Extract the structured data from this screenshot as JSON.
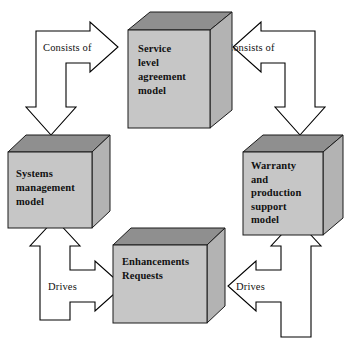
{
  "diagram": {
    "palette": {
      "box_front": "#c6c6c6",
      "box_top": "#8f8f8f",
      "box_side": "#b3b3b3",
      "box_outline": "#1a1a1a",
      "arrow_fill": "#ffffff",
      "arrow_outline": "#000000",
      "text": "#111111",
      "background": "#ffffff"
    },
    "nodes": [
      {
        "id": "service-level-agreement-model",
        "position": "top",
        "lines": [
          "Service",
          "level",
          "agreement",
          "model"
        ]
      },
      {
        "id": "systems-management-model",
        "position": "left",
        "lines": [
          "Systems",
          "management",
          "model"
        ]
      },
      {
        "id": "warranty-and-production-support-model",
        "position": "right",
        "lines": [
          "Warranty",
          "and",
          "production",
          "support",
          "model"
        ]
      },
      {
        "id": "enhancements-requests",
        "position": "bottom",
        "lines": [
          "Enhancements",
          "Requests"
        ]
      }
    ],
    "connectors": [
      {
        "id": "connector-top-left",
        "label": "Consists of",
        "from": "service-level-agreement-model",
        "to": "systems-management-model",
        "heads": [
          "right",
          "down"
        ]
      },
      {
        "id": "connector-top-right",
        "label": "Consists of",
        "from": "service-level-agreement-model",
        "to": "warranty-and-production-support-model",
        "heads": [
          "left",
          "down"
        ]
      },
      {
        "id": "connector-bottom-left",
        "label": "Drives",
        "from": "enhancements-requests",
        "to": "systems-management-model",
        "heads": [
          "up",
          "right"
        ]
      },
      {
        "id": "connector-bottom-right",
        "label": "Drives",
        "from": "enhancements-requests",
        "to": "warranty-and-production-support-model",
        "heads": [
          "up",
          "left"
        ]
      }
    ]
  }
}
